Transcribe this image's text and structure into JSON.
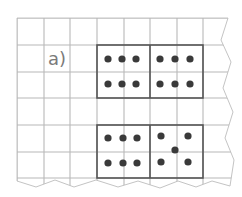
{
  "exercise": {
    "label": "a)",
    "grid": {
      "origin_x": 17,
      "origin_y": 18,
      "cell": 26.6,
      "cols": 8,
      "rows": 6,
      "line_color": "#b8b8b8",
      "box_color": "#555555",
      "dot_color": "#3a3a3a"
    },
    "boxes": [
      {
        "name": "top-left",
        "dots": 6,
        "pattern": "two rows of three"
      },
      {
        "name": "top-right",
        "dots": 6,
        "pattern": "two rows of three"
      },
      {
        "name": "bottom-left",
        "dots": 6,
        "pattern": "two rows of three"
      },
      {
        "name": "bottom-right",
        "dots": 5,
        "pattern": "five-dice pattern"
      }
    ]
  }
}
